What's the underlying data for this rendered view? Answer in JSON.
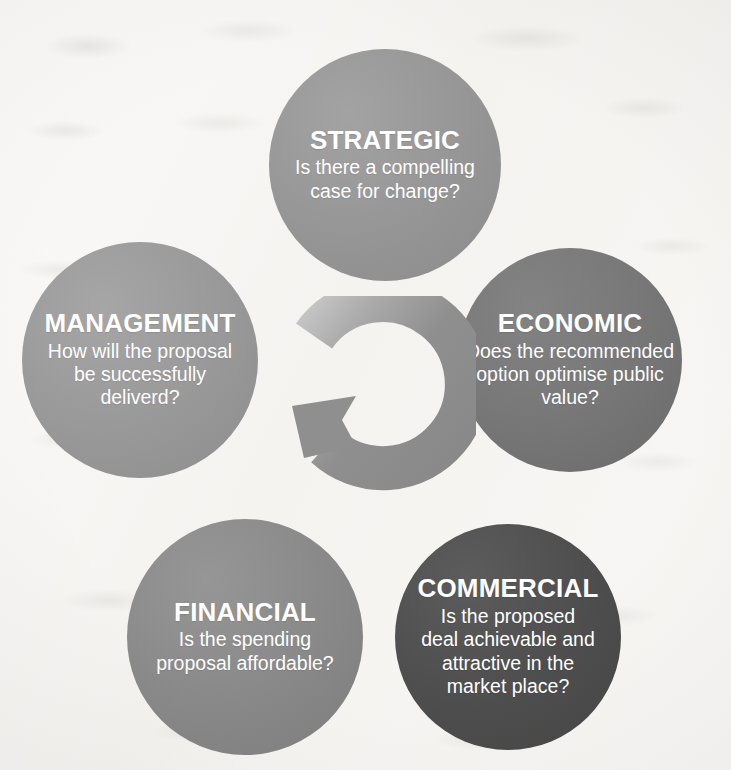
{
  "diagram": {
    "background_color": "#f7f6f4",
    "text_color": "#ffffff",
    "center_icon": "circular-arrow-icon",
    "center_icon_color": "#8f8f8f",
    "nodes": [
      {
        "id": "strategic",
        "title": "STRATEGIC",
        "description": "Is there a compelling\ncase for change?",
        "color": "#969696",
        "position": "top"
      },
      {
        "id": "economic",
        "title": "ECONOMIC",
        "description": "Does the recommended\noption optimise public\nvalue?",
        "color": "#787878",
        "position": "right"
      },
      {
        "id": "management",
        "title": "MANAGEMENT",
        "description": "How will the proposal\nbe successfully\ndeliverd?",
        "color": "#9a9a9a",
        "position": "left"
      },
      {
        "id": "financial",
        "title": "FINANCIAL",
        "description": "Is the spending\nproposal affordable?",
        "color": "#8a8a8a",
        "position": "bottom-left"
      },
      {
        "id": "commercial",
        "title": "COMMERCIAL",
        "description": "Is the proposed\ndeal achievable and\nattractive in the\nmarket place?",
        "color": "#4f4f4f",
        "position": "bottom-right"
      }
    ]
  }
}
